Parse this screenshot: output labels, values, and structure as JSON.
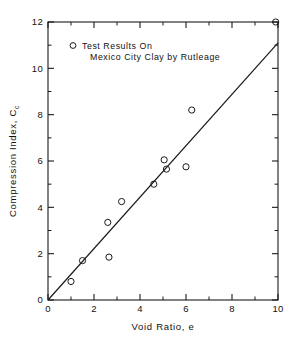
{
  "chart_data": {
    "type": "scatter",
    "title": "",
    "xlabel": "Void Ratio, e",
    "ylabel": "Compression Index, C",
    "ylabel_subscript": "c",
    "xlim": [
      0,
      10
    ],
    "ylim": [
      0,
      12
    ],
    "xticks": [
      0,
      2,
      4,
      6,
      8,
      10
    ],
    "yticks": [
      0,
      2,
      4,
      6,
      8,
      10,
      12
    ],
    "xtick_labels": [
      "0",
      "2",
      "4",
      "6",
      "8",
      "10"
    ],
    "ytick_labels": [
      "0",
      "2",
      "4",
      "6",
      "8",
      "10",
      "12"
    ],
    "x_minor_ticks": [
      1,
      3,
      5,
      7,
      9
    ],
    "y_minor_ticks": [
      1,
      3,
      5,
      7,
      9,
      11
    ],
    "grid": false,
    "frame": "box",
    "tick_direction": "in",
    "legend_position": "upper-left-inside",
    "marker_style": "open-circle",
    "series": [
      {
        "name": "Test Results On Mexico City Clay by Rutleage",
        "marker": "open-circle",
        "points": [
          {
            "x": 1.0,
            "y": 0.8
          },
          {
            "x": 1.5,
            "y": 1.7
          },
          {
            "x": 2.6,
            "y": 3.35
          },
          {
            "x": 2.65,
            "y": 1.85
          },
          {
            "x": 3.2,
            "y": 4.25
          },
          {
            "x": 4.6,
            "y": 5.0
          },
          {
            "x": 5.05,
            "y": 6.05
          },
          {
            "x": 5.15,
            "y": 5.65
          },
          {
            "x": 6.0,
            "y": 5.75
          },
          {
            "x": 6.25,
            "y": 8.2
          },
          {
            "x": 9.9,
            "y": 12.0
          }
        ]
      }
    ],
    "fit_line": {
      "name": "best-fit line",
      "x_start": 0.0,
      "y_start": 0.0,
      "x_end": 10.0,
      "y_end": 11.1,
      "slope": 1.11,
      "intercept": 0.0
    },
    "annotations": []
  },
  "legend": {
    "marker_symbol": "o",
    "line1": "Test  Results  On",
    "line2": "Mexico  City  Clay  by  Rutleage"
  },
  "colors": {
    "ink": "#1a1a1a",
    "background": "#ffffff"
  }
}
